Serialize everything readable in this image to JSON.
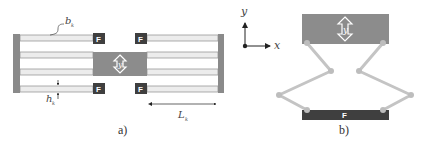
{
  "figure": {
    "panel_a": {
      "caption": "a)",
      "beam_width_label": "b",
      "beam_width_subscript": "k",
      "beam_height_label": "h",
      "beam_height_subscript": "k",
      "beam_length_label": "L",
      "beam_length_subscript": "k",
      "force_markers": [
        "F",
        "F",
        "F",
        "F"
      ],
      "shuttle_label": "y"
    },
    "panel_b": {
      "caption": "b)",
      "axis_x_label": "x",
      "axis_y_label": "y",
      "shuttle_label": "y",
      "force_label": "F"
    },
    "colors": {
      "anchor": "#8a8a8a",
      "beam_fill": "#ececec",
      "beam_line": "#9a9a9a",
      "force_box": "#3f3f3f",
      "shuttle": "#8c8c8c",
      "linkage": "#c4c4c4",
      "joint": "#bdbdbd"
    }
  }
}
